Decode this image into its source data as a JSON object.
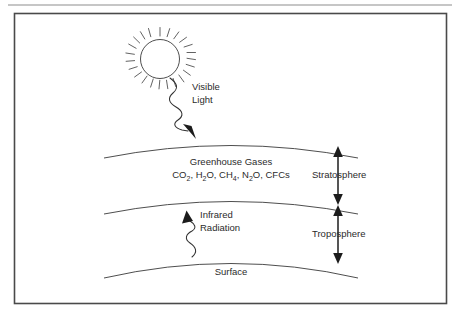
{
  "figure": {
    "title_text": "",
    "labels": {
      "visible_light_line1": "Visible",
      "visible_light_line2": "Light",
      "greenhouse_gases": "Greenhouse Gases",
      "gas_formula_parts": [
        {
          "text": "CO",
          "sub": "2"
        },
        {
          "text": ", H",
          "sub": "2"
        },
        {
          "text": "O, CH",
          "sub": "4"
        },
        {
          "text": ", N",
          "sub": "2"
        },
        {
          "text": "O, CFCs",
          "sub": ""
        }
      ],
      "gas_formula_plain": "CO2, H2O, CH4, N2O, CFCs",
      "stratosphere": "Stratosphere",
      "troposphere": "Troposphere",
      "infrared_line1": "Infrared",
      "infrared_line2": "Radiation",
      "surface": "Surface"
    },
    "icons": {
      "sun": "sun-icon",
      "visible_light_wave": "wavy-down-arrow-icon",
      "infrared_wave": "wavy-up-arrow-icon",
      "stratosphere_extent": "double-headed-vertical-arrow-icon",
      "troposphere_extent": "double-headed-vertical-arrow-icon"
    },
    "colors": {
      "ink": "#2b2b2b",
      "line": "#3a3a3a",
      "arrow": "#1c1c1c",
      "frame": "#4a4a4a",
      "rule": "#8d8d8d",
      "background": "#ffffff"
    },
    "geometry": {
      "sun_center_x": 160,
      "sun_center_y": 59,
      "sun_radius": 20,
      "sun_ray_count": 20,
      "stratosphere_top_apex_y": 140,
      "stratosphere_bottom_apex_y": 196,
      "surface_apex_y": 255
    }
  }
}
